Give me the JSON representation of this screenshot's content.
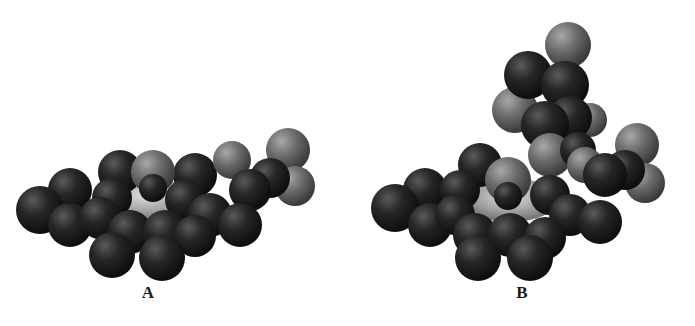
{
  "figure": {
    "background": "#ffffff",
    "colors": {
      "carbon": "#1c1c1c",
      "carbon_highlight": "#5a5a5a",
      "hetero": "#5e5e5e",
      "hetero_highlight": "#a8a8a8",
      "ring": "#9a9a9a",
      "ring_highlight": "#e0e0e0"
    },
    "panels": [
      {
        "label": "A",
        "label_pos": [
          148,
          293
        ],
        "offset_x": 0,
        "width": 340,
        "ring": {
          "cx": 145,
          "cy": 200,
          "rx": 50,
          "ry": 22
        },
        "spheres": [
          {
            "x": 120,
            "y": 172,
            "r": 22,
            "type": "carbon"
          },
          {
            "x": 195,
            "y": 175,
            "r": 22,
            "type": "carbon"
          },
          {
            "x": 232,
            "y": 160,
            "r": 19,
            "type": "hetero"
          },
          {
            "x": 288,
            "y": 150,
            "r": 22,
            "type": "hetero"
          },
          {
            "x": 295,
            "y": 186,
            "r": 20,
            "type": "hetero"
          },
          {
            "x": 270,
            "y": 178,
            "r": 20,
            "type": "carbon"
          },
          {
            "x": 250,
            "y": 190,
            "r": 21,
            "type": "carbon"
          },
          {
            "x": 70,
            "y": 190,
            "r": 22,
            "type": "carbon"
          },
          {
            "x": 112,
            "y": 198,
            "r": 20,
            "type": "carbon"
          },
          {
            "x": 185,
            "y": 200,
            "r": 20,
            "type": "carbon"
          },
          {
            "x": 40,
            "y": 210,
            "r": 24,
            "type": "carbon"
          },
          {
            "x": 70,
            "y": 225,
            "r": 22,
            "type": "carbon"
          },
          {
            "x": 100,
            "y": 218,
            "r": 21,
            "type": "carbon"
          },
          {
            "x": 210,
            "y": 215,
            "r": 22,
            "type": "carbon"
          },
          {
            "x": 240,
            "y": 225,
            "r": 22,
            "type": "carbon"
          },
          {
            "x": 130,
            "y": 232,
            "r": 22,
            "type": "carbon"
          },
          {
            "x": 165,
            "y": 232,
            "r": 22,
            "type": "carbon"
          },
          {
            "x": 195,
            "y": 236,
            "r": 21,
            "type": "carbon"
          },
          {
            "x": 112,
            "y": 255,
            "r": 23,
            "type": "carbon"
          },
          {
            "x": 162,
            "y": 258,
            "r": 23,
            "type": "carbon"
          },
          {
            "x": 153,
            "y": 172,
            "r": 22,
            "type": "hetero"
          },
          {
            "x": 153,
            "y": 188,
            "r": 14,
            "type": "carbon"
          }
        ]
      },
      {
        "label": "B",
        "label_pos": [
          522,
          293
        ],
        "offset_x": 360,
        "width": 335,
        "ring": {
          "cx": 510,
          "cy": 200,
          "rx": 48,
          "ry": 22
        },
        "spheres": [
          {
            "x": 568,
            "y": 45,
            "r": 23,
            "type": "hetero"
          },
          {
            "x": 515,
            "y": 110,
            "r": 23,
            "type": "hetero"
          },
          {
            "x": 590,
            "y": 120,
            "r": 17,
            "type": "hetero"
          },
          {
            "x": 528,
            "y": 75,
            "r": 24,
            "type": "carbon"
          },
          {
            "x": 565,
            "y": 85,
            "r": 24,
            "type": "carbon"
          },
          {
            "x": 570,
            "y": 118,
            "r": 22,
            "type": "carbon"
          },
          {
            "x": 545,
            "y": 125,
            "r": 24,
            "type": "carbon"
          },
          {
            "x": 550,
            "y": 155,
            "r": 22,
            "type": "hetero"
          },
          {
            "x": 578,
            "y": 150,
            "r": 18,
            "type": "carbon"
          },
          {
            "x": 585,
            "y": 165,
            "r": 18,
            "type": "hetero"
          },
          {
            "x": 480,
            "y": 165,
            "r": 22,
            "type": "carbon"
          },
          {
            "x": 637,
            "y": 145,
            "r": 22,
            "type": "hetero"
          },
          {
            "x": 645,
            "y": 183,
            "r": 20,
            "type": "hetero"
          },
          {
            "x": 625,
            "y": 170,
            "r": 20,
            "type": "carbon"
          },
          {
            "x": 605,
            "y": 175,
            "r": 22,
            "type": "carbon"
          },
          {
            "x": 425,
            "y": 190,
            "r": 22,
            "type": "carbon"
          },
          {
            "x": 460,
            "y": 190,
            "r": 20,
            "type": "carbon"
          },
          {
            "x": 550,
            "y": 195,
            "r": 20,
            "type": "carbon"
          },
          {
            "x": 395,
            "y": 208,
            "r": 24,
            "type": "carbon"
          },
          {
            "x": 430,
            "y": 225,
            "r": 22,
            "type": "carbon"
          },
          {
            "x": 455,
            "y": 215,
            "r": 20,
            "type": "carbon"
          },
          {
            "x": 570,
            "y": 215,
            "r": 21,
            "type": "carbon"
          },
          {
            "x": 600,
            "y": 222,
            "r": 22,
            "type": "carbon"
          },
          {
            "x": 475,
            "y": 235,
            "r": 22,
            "type": "carbon"
          },
          {
            "x": 510,
            "y": 235,
            "r": 22,
            "type": "carbon"
          },
          {
            "x": 545,
            "y": 238,
            "r": 21,
            "type": "carbon"
          },
          {
            "x": 478,
            "y": 258,
            "r": 23,
            "type": "carbon"
          },
          {
            "x": 530,
            "y": 258,
            "r": 23,
            "type": "carbon"
          },
          {
            "x": 508,
            "y": 180,
            "r": 23,
            "type": "hetero"
          },
          {
            "x": 508,
            "y": 196,
            "r": 14,
            "type": "carbon"
          }
        ]
      }
    ]
  }
}
